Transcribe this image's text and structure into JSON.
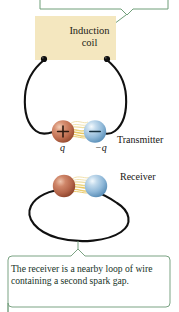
{
  "figure": {
    "title_box": {
      "label": "Induction coil",
      "line1": "Induction",
      "line2": "coil",
      "fill_color": "#f4e7bf",
      "text_color": "#231d16"
    },
    "callout_top": {
      "border_color": "#6f9e78",
      "note": "callout box cropped at top edge of image"
    },
    "transmitter": {
      "label": "Transmitter",
      "positive_charge_label": "q",
      "negative_charge_label": "−q",
      "positive_sign": "+",
      "negative_sign": "−",
      "positive_sphere_color": "#c4765a",
      "negative_sphere_color": "#8fb9d8",
      "spark_color": "#e8c858",
      "wire_color": "#111111"
    },
    "receiver": {
      "label": "Receiver",
      "left_sphere_color": "#bb6f55",
      "right_sphere_color": "#8fb9d8",
      "spark_color": "#e8c858",
      "wire_color": "#111111"
    },
    "caption": {
      "text": "The receiver is a nearby loop of wire containing a second spark gap.",
      "border_color": "#7ba383",
      "text_color": "#17331f"
    }
  }
}
